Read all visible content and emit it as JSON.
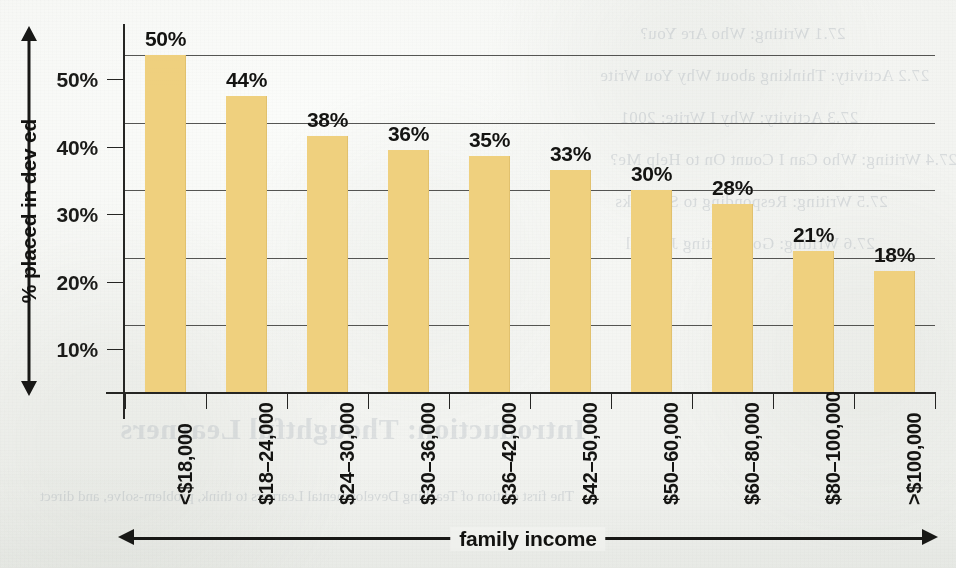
{
  "chart_data": {
    "type": "bar",
    "title": "",
    "xlabel": "family income",
    "ylabel": "% placed in dev ed",
    "categories": [
      "<$18,000",
      "$18–24,000",
      "$24–30,000",
      "$30–36,000",
      "$36–42,000",
      "$42–50,000",
      "$50–60,000",
      "$60–80,000",
      "$80–100,000",
      ">$100,000"
    ],
    "values": [
      50,
      44,
      38,
      36,
      35,
      33,
      30,
      28,
      21,
      18
    ],
    "data_labels": [
      "50%",
      "44%",
      "38%",
      "36%",
      "35%",
      "33%",
      "30%",
      "28%",
      "21%",
      "18%"
    ],
    "ylim": [
      0,
      50
    ],
    "ytick_values": [
      10,
      20,
      30,
      40,
      50
    ],
    "ytick_labels": [
      "10%",
      "20%",
      "30%",
      "40%",
      "50%"
    ],
    "grid": "horizontal",
    "legend": "none",
    "bar_color": "#efd07e",
    "axis_color": "#252523",
    "text_color": "#141412",
    "background_color": "#f4f5f2"
  },
  "axes": {
    "y_title": "% placed in dev ed",
    "x_title": "family income"
  },
  "bleed_through": {
    "note": "faint mirror-reversed text showing through from the reverse side of the scanned page",
    "lines": [
      "27.1    Writing: Who Are You?",
      "27.2    Activity: Thinking about Why You Write",
      "27.3    Activity: Why I Write: 2001",
      "27.4    Writing: Who Can I Count On to Help Me?",
      "27.5    Writing: Responding to Setbacks",
      "27.6    Writing: Goal-Setting Journal",
      "Introduction: Thoughtful Learners",
      "The first edition of Teaching Developmental Learners to think, problem-solve, and direct"
    ]
  }
}
